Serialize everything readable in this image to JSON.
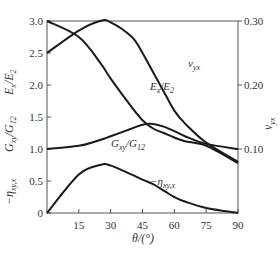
{
  "chart_data": {
    "type": "line",
    "title": "",
    "xlabel": "θ/(°)",
    "ylabel_left": [
      "E_x/E_2",
      "G_xy/G_12",
      "−η_xy,x"
    ],
    "ylabel_right": "ν_yx",
    "xlim": [
      0,
      90
    ],
    "ylim_left": [
      0,
      3.0
    ],
    "ylim_right": [
      0,
      0.3
    ],
    "x_ticks": [
      15,
      30,
      45,
      60,
      75,
      90
    ],
    "y_ticks_left": [
      0,
      0.5,
      1.0,
      1.5,
      2.0,
      2.5,
      3.0
    ],
    "y_ticks_right": [
      0.1,
      0.2,
      0.3
    ],
    "grid": false,
    "legend": "inline curve labels",
    "x": [
      0,
      15,
      25,
      30,
      40,
      45,
      50,
      55,
      60,
      65,
      75,
      90
    ],
    "series": [
      {
        "name": "E_x/E_2",
        "axis": "left",
        "values": [
          3.0,
          2.75,
          2.35,
          2.1,
          1.65,
          1.45,
          1.32,
          1.25,
          1.18,
          1.12,
          1.05,
          0.78
        ]
      },
      {
        "name": "ν_yx",
        "axis": "right",
        "values": [
          0.25,
          0.285,
          0.3,
          0.298,
          0.275,
          0.25,
          0.22,
          0.19,
          0.16,
          0.14,
          0.11,
          0.08
        ]
      },
      {
        "name": "G_xy/G_12",
        "axis": "left",
        "values": [
          1.0,
          1.05,
          1.14,
          1.2,
          1.32,
          1.38,
          1.39,
          1.35,
          1.28,
          1.2,
          1.08,
          1.0
        ]
      },
      {
        "name": "−η_xy,x",
        "axis": "left",
        "values": [
          0.0,
          0.6,
          0.75,
          0.74,
          0.6,
          0.52,
          0.45,
          0.35,
          0.25,
          0.18,
          0.08,
          0.0
        ]
      }
    ]
  },
  "labels": {
    "x_axis_title": "θ/(°)",
    "y_left_1": "E",
    "y_left_1_sub": "x",
    "y_left_1_den": "/E",
    "y_left_1_den_sub": "2",
    "y_left_2": "G",
    "y_left_2_sub": "xy",
    "y_left_2_den": "/G",
    "y_left_2_den_sub": "12",
    "y_left_3": "−η",
    "y_left_3_sub": "xy,x",
    "y_right": "ν",
    "y_right_sub": "yx",
    "curve_nu": "ν",
    "curve_nu_sub": "yx",
    "curve_E": "E",
    "curve_E_sub": "x",
    "curve_E_den": "/E",
    "curve_E_den_sub": "2",
    "curve_G": "G",
    "curve_G_sub": "xy",
    "curve_G_den": "/G",
    "curve_G_den_sub": "12",
    "curve_eta": "−η",
    "curve_eta_sub": "xy,x"
  }
}
